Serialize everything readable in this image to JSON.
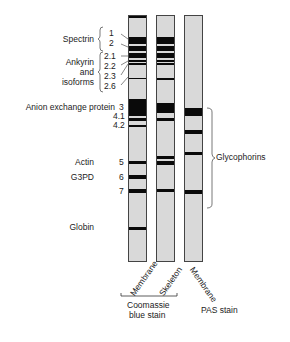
{
  "proteins": {
    "spectrin": "Spectrin",
    "ankyrin": [
      "Ankyrin",
      "and",
      "isoforms"
    ],
    "anion": "Anion exchange protein",
    "actin": "Actin",
    "g3pd": "G3PD",
    "globin": "Globin",
    "glycophorins": "Glycophorins"
  },
  "band_numbers": [
    "1",
    "2",
    "2.1",
    "2.2",
    "2.3",
    "2.6",
    "3",
    "4.1",
    "4.2",
    "5",
    "6",
    "7"
  ],
  "lanes": [
    {
      "label": "Membrane",
      "stain": "Coomassie blue stain"
    },
    {
      "label": "Skeleton",
      "stain": "Coomassie blue stain"
    },
    {
      "label": "Membrane",
      "stain": "PAS stain"
    }
  ],
  "stains": {
    "coomassie": [
      "Coomassie",
      "blue stain"
    ],
    "pas": "PAS stain"
  },
  "colors": {
    "band": "#0a0a0a",
    "lane_bg": "#d9d9d9"
  }
}
